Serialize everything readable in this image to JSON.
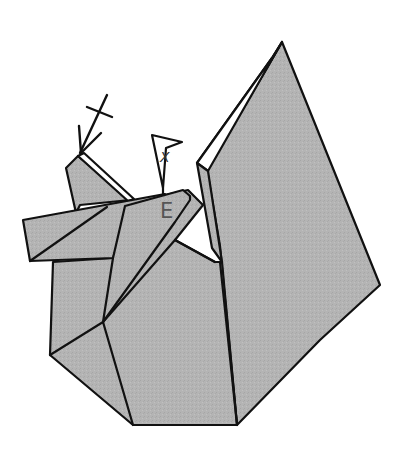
{
  "diagram": {
    "type": "origami-folding-step",
    "labels": {
      "reference_point": "E",
      "flag_marker": "X"
    },
    "symbols": [
      {
        "name": "valley-fold-arrow",
        "description": "arrow with crossed tail pointing to left ear tip"
      },
      {
        "name": "flag-marker",
        "description": "pennant-shaped marker labelled X"
      }
    ],
    "colors": {
      "paper": "#b4b4b4",
      "paper_reverse": "#ffffff",
      "line": "#111111",
      "label": "#555555",
      "background": "#ffffff"
    }
  }
}
